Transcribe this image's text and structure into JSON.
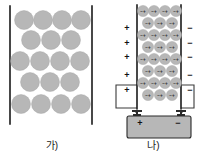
{
  "figure": {
    "title": "",
    "background_color": "#ffffff",
    "width": 207,
    "height": 164
  },
  "panel_a": {
    "caption": "가)",
    "description": "nonpolar-random-molecules",
    "molecule_fill": "#b7b7b7",
    "plate_color": "#1a1a1a",
    "rows": [
      {
        "count": 4,
        "symbols": [
          "",
          "",
          "",
          ""
        ]
      },
      {
        "count": 3,
        "symbols": [
          "",
          "",
          ""
        ]
      },
      {
        "count": 4,
        "symbols": [
          "",
          "",
          "",
          ""
        ]
      },
      {
        "count": 3,
        "symbols": [
          "",
          "",
          ""
        ]
      },
      {
        "count": 4,
        "symbols": [
          "",
          "",
          "",
          ""
        ]
      }
    ],
    "total_molecules": 18,
    "left_plate_label": "",
    "right_plate_label": ""
  },
  "panel_b": {
    "caption": "나)",
    "description": "polarized-molecules-between-charged-plates",
    "molecule_fill": "#b7b7b7",
    "plate_color": "#1a1a1a",
    "molecule_symbol": "−+",
    "rows": [
      {
        "count": 4
      },
      {
        "count": 3
      },
      {
        "count": 4
      },
      {
        "count": 3
      },
      {
        "count": 4
      },
      {
        "count": 3
      },
      {
        "count": 4
      },
      {
        "count": 3
      }
    ],
    "total_molecules": 28,
    "left_plate_signs": [
      "+",
      "+",
      "+",
      "+",
      "+"
    ],
    "right_plate_signs": [
      "−",
      "−",
      "−",
      "−",
      "−"
    ],
    "battery": {
      "positive_terminal_label": "+",
      "negative_terminal_label": "−",
      "body_color": "#b7b7b7"
    }
  }
}
